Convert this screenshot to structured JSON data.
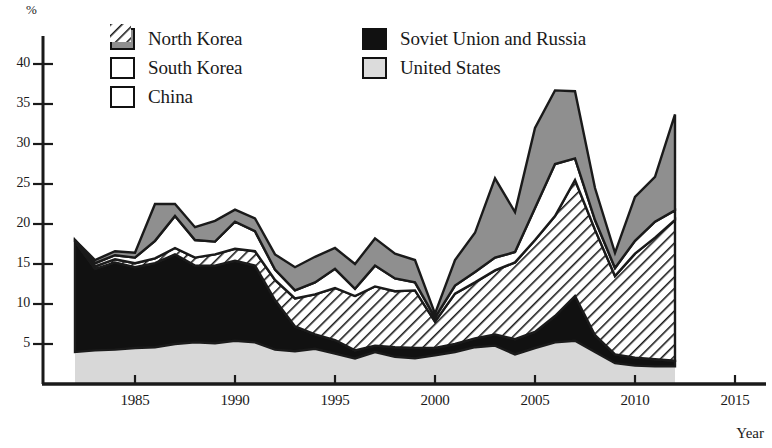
{
  "chart_data": {
    "type": "area",
    "stacked": true,
    "title": "",
    "xlabel": "Year",
    "ylabel": "%",
    "yunit_label": "%",
    "xlim": [
      1982,
      2016.5
    ],
    "ylim": [
      0,
      42
    ],
    "xticks": [
      1985,
      1990,
      1995,
      2000,
      2005,
      2010,
      2015
    ],
    "xtick_labels": [
      "1985",
      "1990",
      "1995",
      "2000",
      "2005",
      "2010",
      "2015"
    ],
    "yticks": [
      5,
      10,
      15,
      20,
      25,
      30,
      35,
      40
    ],
    "ytick_labels": [
      "5",
      "10",
      "15",
      "20",
      "25",
      "30",
      "35",
      "40"
    ],
    "grid": false,
    "legend_position": "top-center",
    "x": [
      1982,
      1983,
      1984,
      1985,
      1986,
      1987,
      1988,
      1989,
      1990,
      1991,
      1992,
      1993,
      1994,
      1995,
      1996,
      1997,
      1998,
      1999,
      2000,
      2001,
      2002,
      2003,
      2004,
      2005,
      2006,
      2007,
      2008,
      2009,
      2010,
      2011,
      2012
    ],
    "series": [
      {
        "name": "United States",
        "fill": "#d8d8d8",
        "pattern": "solid-light",
        "values": [
          4.0,
          4.2,
          4.3,
          4.5,
          4.6,
          5.0,
          5.2,
          5.1,
          5.4,
          5.2,
          4.3,
          4.1,
          4.4,
          3.8,
          3.2,
          4.0,
          3.4,
          3.2,
          3.6,
          4.0,
          4.6,
          4.8,
          3.7,
          4.5,
          5.2,
          5.4,
          4.0,
          2.6,
          2.3,
          2.2,
          2.2
        ]
      },
      {
        "name": "Soviet Union and Russia",
        "fill": "#111111",
        "pattern": "solid-black",
        "values": [
          13.8,
          10.2,
          10.9,
          10.1,
          10.5,
          11.2,
          9.6,
          9.7,
          10.0,
          9.6,
          6.2,
          3.1,
          1.8,
          1.7,
          1.0,
          0.8,
          1.2,
          1.3,
          0.9,
          1.0,
          1.1,
          1.4,
          1.9,
          2.0,
          3.3,
          5.6,
          2.1,
          1.1,
          1.0,
          0.9,
          0.7
        ]
      },
      {
        "name": "China",
        "fill": "#ffffff",
        "pattern": "hatch",
        "values": [
          0.0,
          0.3,
          0.4,
          0.5,
          0.6,
          0.8,
          1.0,
          1.4,
          1.5,
          1.8,
          2.5,
          3.5,
          5.0,
          6.5,
          6.8,
          7.4,
          7.0,
          7.2,
          3.3,
          6.3,
          7.0,
          8.0,
          9.6,
          11.5,
          12.5,
          14.5,
          13.2,
          9.8,
          13.0,
          15.2,
          17.6
        ]
      },
      {
        "name": "South Korea",
        "fill": "#ffffff",
        "pattern": "white",
        "values": [
          0.2,
          0.4,
          0.5,
          0.7,
          2.2,
          4.0,
          2.2,
          1.6,
          3.4,
          2.5,
          1.3,
          1.0,
          1.5,
          2.4,
          0.9,
          2.6,
          1.6,
          1.0,
          0.5,
          1.0,
          1.3,
          1.6,
          1.3,
          4.0,
          6.5,
          2.7,
          1.2,
          1.0,
          1.6,
          2.0,
          1.2
        ]
      },
      {
        "name": "North Korea",
        "fill": "#8f8f8f",
        "pattern": "solid-gray",
        "values": [
          0.0,
          0.4,
          0.5,
          0.6,
          4.6,
          1.5,
          1.6,
          2.6,
          1.5,
          1.6,
          1.9,
          2.9,
          3.2,
          2.6,
          3.1,
          3.4,
          3.1,
          2.8,
          0.5,
          3.2,
          4.9,
          9.9,
          5.0,
          10.0,
          9.2,
          8.4,
          4.0,
          1.9,
          5.5,
          5.6,
          12.0
        ]
      }
    ]
  },
  "legend": {
    "items": [
      {
        "label": "North Korea",
        "swatch": "solid-gray"
      },
      {
        "label": "South Korea",
        "swatch": "white"
      },
      {
        "label": "China",
        "swatch": "hatch"
      },
      {
        "label": "Soviet Union and Russia",
        "swatch": "solid-black"
      },
      {
        "label": "United States",
        "swatch": "solid-light"
      }
    ]
  },
  "axes": {
    "y_unit": "%",
    "x_title": "Year"
  }
}
